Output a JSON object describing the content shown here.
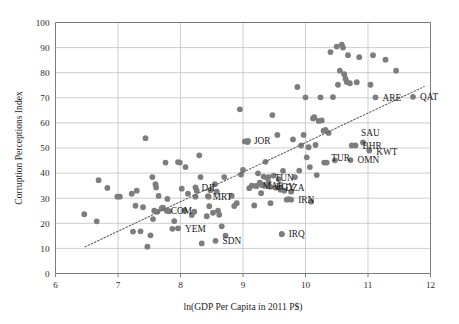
{
  "chart_data": {
    "type": "scatter",
    "title": "",
    "xlabel": "ln(GDP Per Capita in 2011 P$)",
    "ylabel": "Corruption Perceptions Index",
    "xlim": [
      6,
      12
    ],
    "ylim": [
      0,
      100
    ],
    "xticks": [
      6,
      7,
      8,
      9,
      10,
      11,
      12
    ],
    "yticks": [
      0,
      10,
      20,
      30,
      40,
      50,
      60,
      70,
      80,
      90,
      100
    ],
    "grid": "horizontal-and-vertical",
    "legend": "none",
    "marker_color": "#7d7d7d",
    "trend_color": "#5d5d5d",
    "trendline": {
      "style": "dotted",
      "x_start": 6.47,
      "y_start": 10.6,
      "x_end": 11.9,
      "y_end": 74.5
    },
    "points": [
      {
        "x": 6.46,
        "y": 23.6
      },
      {
        "x": 6.66,
        "y": 20.8
      },
      {
        "x": 6.69,
        "y": 37.2
      },
      {
        "x": 6.83,
        "y": 34.1
      },
      {
        "x": 6.99,
        "y": 30.6
      },
      {
        "x": 7.03,
        "y": 30.6
      },
      {
        "x": 7.22,
        "y": 31.8
      },
      {
        "x": 7.24,
        "y": 16.7
      },
      {
        "x": 7.28,
        "y": 27.0
      },
      {
        "x": 7.3,
        "y": 33.0
      },
      {
        "x": 7.36,
        "y": 16.8
      },
      {
        "x": 7.4,
        "y": 26.4
      },
      {
        "x": 7.44,
        "y": 53.9
      },
      {
        "x": 7.47,
        "y": 10.7
      },
      {
        "x": 7.52,
        "y": 15.2
      },
      {
        "x": 7.55,
        "y": 38.4
      },
      {
        "x": 7.56,
        "y": 21.7
      },
      {
        "x": 7.58,
        "y": 25.0
      },
      {
        "x": 7.6,
        "y": 35.6
      },
      {
        "x": 7.61,
        "y": 34.3
      },
      {
        "x": 7.63,
        "y": 24.6
      },
      {
        "x": 7.65,
        "y": 30.9
      },
      {
        "x": 7.7,
        "y": 26.0
      },
      {
        "x": 7.72,
        "y": 26.2
      },
      {
        "x": 7.76,
        "y": 44.2
      },
      {
        "x": 7.79,
        "y": 29.7
      },
      {
        "x": 7.82,
        "y": 24.8
      },
      {
        "x": 7.87,
        "y": 17.8
      },
      {
        "x": 7.9,
        "y": 20.9
      },
      {
        "x": 7.96,
        "y": 44.4
      },
      {
        "x": 7.99,
        "y": 44.2
      },
      {
        "x": 8.02,
        "y": 33.8
      },
      {
        "x": 8.06,
        "y": 25.0
      },
      {
        "x": 8.08,
        "y": 42.4
      },
      {
        "x": 8.12,
        "y": 31.8
      },
      {
        "x": 8.18,
        "y": 23.3
      },
      {
        "x": 8.22,
        "y": 24.6
      },
      {
        "x": 8.24,
        "y": 30.6
      },
      {
        "x": 8.26,
        "y": 33.0
      },
      {
        "x": 8.3,
        "y": 47.1
      },
      {
        "x": 8.32,
        "y": 38.4
      },
      {
        "x": 8.34,
        "y": 12.0
      },
      {
        "x": 8.42,
        "y": 22.8
      },
      {
        "x": 8.44,
        "y": 30.8
      },
      {
        "x": 8.46,
        "y": 26.8
      },
      {
        "x": 8.48,
        "y": 33.2
      },
      {
        "x": 8.52,
        "y": 24.2
      },
      {
        "x": 8.55,
        "y": 35.6
      },
      {
        "x": 8.58,
        "y": 32.6
      },
      {
        "x": 8.6,
        "y": 25.0
      },
      {
        "x": 8.62,
        "y": 23.4
      },
      {
        "x": 8.66,
        "y": 18.8
      },
      {
        "x": 8.7,
        "y": 38.4
      },
      {
        "x": 8.72,
        "y": 15.1
      },
      {
        "x": 8.82,
        "y": 30.9
      },
      {
        "x": 8.86,
        "y": 26.9
      },
      {
        "x": 8.9,
        "y": 28.0
      },
      {
        "x": 8.95,
        "y": 65.4
      },
      {
        "x": 8.97,
        "y": 39.4
      },
      {
        "x": 9.0,
        "y": 41.3
      },
      {
        "x": 9.03,
        "y": 52.6
      },
      {
        "x": 9.07,
        "y": 52.4
      },
      {
        "x": 9.1,
        "y": 34.0
      },
      {
        "x": 9.14,
        "y": 35.0
      },
      {
        "x": 9.18,
        "y": 27.1
      },
      {
        "x": 9.21,
        "y": 34.9
      },
      {
        "x": 9.24,
        "y": 39.9
      },
      {
        "x": 9.27,
        "y": 36.2
      },
      {
        "x": 9.29,
        "y": 32.0
      },
      {
        "x": 9.31,
        "y": 35.2
      },
      {
        "x": 9.33,
        "y": 38.6
      },
      {
        "x": 9.36,
        "y": 44.5
      },
      {
        "x": 9.38,
        "y": 38.1
      },
      {
        "x": 9.4,
        "y": 34.8
      },
      {
        "x": 9.41,
        "y": 36.3
      },
      {
        "x": 9.44,
        "y": 28.0
      },
      {
        "x": 9.47,
        "y": 63.1
      },
      {
        "x": 9.49,
        "y": 39.0
      },
      {
        "x": 9.52,
        "y": 34.2
      },
      {
        "x": 9.55,
        "y": 55.2
      },
      {
        "x": 9.57,
        "y": 37.6
      },
      {
        "x": 9.6,
        "y": 33.4
      },
      {
        "x": 9.62,
        "y": 15.7
      },
      {
        "x": 9.64,
        "y": 40.9
      },
      {
        "x": 9.66,
        "y": 33.0
      },
      {
        "x": 9.7,
        "y": 29.4
      },
      {
        "x": 9.73,
        "y": 29.6
      },
      {
        "x": 9.77,
        "y": 32.6
      },
      {
        "x": 9.8,
        "y": 53.4
      },
      {
        "x": 9.83,
        "y": 38.4
      },
      {
        "x": 9.87,
        "y": 74.3
      },
      {
        "x": 9.9,
        "y": 41.0
      },
      {
        "x": 9.93,
        "y": 51.0
      },
      {
        "x": 9.97,
        "y": 55.2
      },
      {
        "x": 10.0,
        "y": 70.2
      },
      {
        "x": 10.02,
        "y": 46.3
      },
      {
        "x": 10.05,
        "y": 50.3
      },
      {
        "x": 10.07,
        "y": 42.4
      },
      {
        "x": 10.09,
        "y": 28.6
      },
      {
        "x": 10.12,
        "y": 61.8
      },
      {
        "x": 10.14,
        "y": 62.3
      },
      {
        "x": 10.16,
        "y": 51.2
      },
      {
        "x": 10.18,
        "y": 39.2
      },
      {
        "x": 10.21,
        "y": 60.8
      },
      {
        "x": 10.24,
        "y": 70.2
      },
      {
        "x": 10.26,
        "y": 61.0
      },
      {
        "x": 10.29,
        "y": 56.9
      },
      {
        "x": 10.32,
        "y": 57.2
      },
      {
        "x": 10.34,
        "y": 44.2
      },
      {
        "x": 10.37,
        "y": 56.0
      },
      {
        "x": 10.4,
        "y": 88.2
      },
      {
        "x": 10.44,
        "y": 70.3
      },
      {
        "x": 10.47,
        "y": 45.1
      },
      {
        "x": 10.5,
        "y": 90.4
      },
      {
        "x": 10.52,
        "y": 75.2
      },
      {
        "x": 10.55,
        "y": 80.8
      },
      {
        "x": 10.58,
        "y": 91.2
      },
      {
        "x": 10.6,
        "y": 90.0
      },
      {
        "x": 10.62,
        "y": 79.4
      },
      {
        "x": 10.64,
        "y": 77.6
      },
      {
        "x": 10.66,
        "y": 76.3
      },
      {
        "x": 10.68,
        "y": 87.0
      },
      {
        "x": 10.71,
        "y": 75.8
      },
      {
        "x": 10.74,
        "y": 51.0
      },
      {
        "x": 10.82,
        "y": 76.2
      },
      {
        "x": 10.86,
        "y": 86.2
      },
      {
        "x": 11.04,
        "y": 75.2
      },
      {
        "x": 11.08,
        "y": 87.0
      },
      {
        "x": 11.28,
        "y": 85.2
      },
      {
        "x": 11.45,
        "y": 80.8
      }
    ],
    "labeled_points": [
      {
        "code": "QAT",
        "x": 11.72,
        "y": 70.4,
        "dx": 7,
        "dy": 3.4
      },
      {
        "code": "ARE",
        "x": 11.12,
        "y": 70.2,
        "dx": 7,
        "dy": 3.4
      },
      {
        "code": "SAU",
        "x": 10.92,
        "y": 52.2,
        "dx": -2,
        "dy": -6
      },
      {
        "code": "BHR",
        "x": 10.8,
        "y": 51.0,
        "dx": 7,
        "dy": 3.4
      },
      {
        "code": "KWT",
        "x": 11.02,
        "y": 49.0,
        "dx": 7,
        "dy": 4.2
      },
      {
        "code": "OMN",
        "x": 10.72,
        "y": 45.2,
        "dx": 7,
        "dy": 3.4
      },
      {
        "code": "TUR",
        "x": 10.3,
        "y": 44.2,
        "dx": 7,
        "dy": -2
      },
      {
        "code": "JOR",
        "x": 9.08,
        "y": 52.8,
        "dx": 6,
        "dy": 3.4
      },
      {
        "code": "TUN",
        "x": 9.41,
        "y": 38.4,
        "dx": 6,
        "dy": 3.4
      },
      {
        "code": "MAR",
        "x": 9.22,
        "y": 34.9,
        "dx": 6,
        "dy": 3.4
      },
      {
        "code": "EGY",
        "x": 9.43,
        "y": 34.6,
        "dx": 6,
        "dy": 3.4
      },
      {
        "code": "DZA",
        "x": 9.58,
        "y": 34.3,
        "dx": 6,
        "dy": 3.4
      },
      {
        "code": "IRN",
        "x": 9.77,
        "y": 29.4,
        "dx": 7,
        "dy": 3.4
      },
      {
        "code": "IRQ",
        "x": 9.62,
        "y": 15.7,
        "dx": 7,
        "dy": 3.4
      },
      {
        "code": "DJI",
        "x": 8.24,
        "y": 34.3,
        "dx": 6,
        "dy": 3.4
      },
      {
        "code": "MRT",
        "x": 8.45,
        "y": 30.6,
        "dx": 4,
        "dy": 3.4
      },
      {
        "code": "COM",
        "x": 7.78,
        "y": 25.0,
        "dx": 4,
        "dy": 3.4
      },
      {
        "code": "YEM",
        "x": 7.96,
        "y": 18.0,
        "dx": 7,
        "dy": 3.4
      },
      {
        "code": "SDN",
        "x": 8.56,
        "y": 13.0,
        "dx": 7,
        "dy": 3.4
      }
    ]
  }
}
